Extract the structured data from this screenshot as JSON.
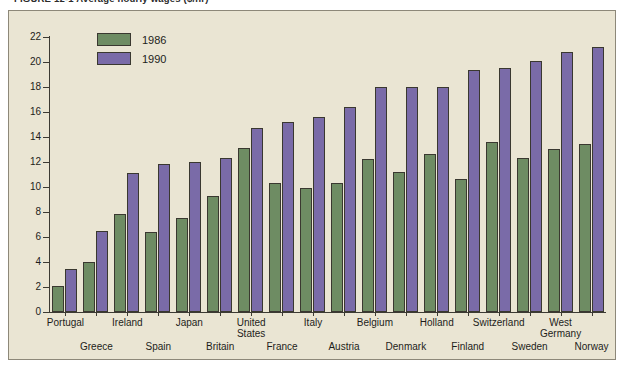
{
  "figure": {
    "caption": "FIGURE 12-1    Average hourly wages ($/hr)"
  },
  "legend": {
    "position": "top-left-inside",
    "entries": [
      {
        "label": "1986",
        "color": "#6e8c63"
      },
      {
        "label": "1990",
        "color": "#7a6ba8"
      }
    ]
  },
  "axis": {
    "y_ticks": [
      "0",
      "2",
      "4",
      "6",
      "8",
      "10",
      "12",
      "14",
      "16",
      "18",
      "20",
      "22"
    ]
  },
  "colors": {
    "panel_background": "#eae5d3",
    "panel_border": "#8d8879",
    "axis": "#3c3a33",
    "series_1986": "#6e8c63",
    "series_1990": "#7a6ba8",
    "bar_outline": "#3a3830",
    "text": "#1d1d1a"
  },
  "chart_data": {
    "type": "bar",
    "title": "FIGURE 12-1    Average hourly wages ($/hr)",
    "xlabel": "",
    "ylabel": "",
    "ylim": [
      0,
      22
    ],
    "ytick_step": 2,
    "grid": false,
    "legend_position": "upper left",
    "categories": [
      "Portugal",
      "Greece",
      "Ireland",
      "Spain",
      "Japan",
      "Britain",
      "United States",
      "France",
      "Italy",
      "Austria",
      "Belgium",
      "Denmark",
      "Holland",
      "Finland",
      "Switzerland",
      "Sweden",
      "West Germany",
      "Norway"
    ],
    "categories_display": [
      "Portugal",
      "Greece",
      "Ireland",
      "Spain",
      "Japan",
      "Britain",
      "United\nStates",
      "France",
      "Italy",
      "Austria",
      "Belgium",
      "Denmark",
      "Holland",
      "Finland",
      "Switzerland",
      "Sweden",
      "West\nGermany",
      "Norway"
    ],
    "series": [
      {
        "name": "1986",
        "color": "#6e8c63",
        "values": [
          2.1,
          4.0,
          7.8,
          6.4,
          7.5,
          9.3,
          13.1,
          10.3,
          9.9,
          10.3,
          12.2,
          11.2,
          12.6,
          10.6,
          13.6,
          12.3,
          13.0,
          13.4
        ]
      },
      {
        "name": "1990",
        "color": "#7a6ba8",
        "values": [
          3.4,
          6.5,
          11.1,
          11.8,
          12.0,
          12.3,
          14.7,
          15.2,
          15.6,
          16.4,
          18.0,
          18.0,
          18.0,
          19.4,
          19.5,
          20.1,
          20.8,
          21.2
        ]
      }
    ]
  }
}
